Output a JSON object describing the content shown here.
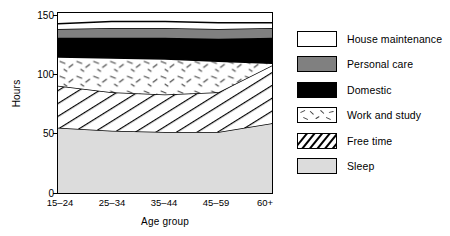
{
  "chart_data": {
    "type": "area",
    "title": "",
    "xlabel": "Age group",
    "ylabel": "Hours",
    "categories": [
      "15–24",
      "25–34",
      "35–44",
      "45–59",
      "60+"
    ],
    "ylim": [
      0,
      168
    ],
    "yticks": [
      0,
      50,
      100,
      150
    ],
    "ytick_labels": [
      "0",
      "50",
      "100",
      "150"
    ],
    "grid": false,
    "legend_position": "right",
    "stacked": true,
    "stack_order_bottom_to_top": [
      "Sleep",
      "Free time",
      "Work and study",
      "Domestic",
      "Personal care",
      "House maintenance"
    ],
    "series": [
      {
        "name": "Sleep",
        "fill": "#dcdcdc",
        "pattern": "solid",
        "values": [
          61,
          58,
          57,
          57,
          65
        ]
      },
      {
        "name": "Free time",
        "fill": "#ffffff",
        "pattern": "diagonal-hatch",
        "values": [
          39,
          36,
          35,
          37,
          54
        ]
      },
      {
        "name": "Work and study",
        "fill": "#ffffff",
        "pattern": "dashes",
        "values": [
          27,
          32,
          33,
          29,
          2
        ]
      },
      {
        "name": "Domestic",
        "fill": "#000000",
        "pattern": "solid",
        "values": [
          18,
          19,
          20,
          21,
          24
        ]
      },
      {
        "name": "Personal care",
        "fill": "#808080",
        "pattern": "solid",
        "values": [
          8,
          9,
          9,
          9,
          9
        ]
      },
      {
        "name": "House maintenance",
        "fill": "#ffffff",
        "pattern": "solid",
        "values": [
          5,
          6,
          6,
          6,
          5
        ]
      }
    ],
    "cumulative_tops": {
      "Sleep": [
        61,
        58,
        57,
        57,
        65
      ],
      "Free time": [
        100,
        94,
        92,
        94,
        119
      ],
      "Work and study": [
        127,
        126,
        125,
        123,
        121
      ],
      "Domestic": [
        145,
        145,
        145,
        144,
        145
      ],
      "Personal care": [
        153,
        154,
        154,
        153,
        154
      ],
      "House maintenance": [
        158,
        160,
        160,
        159,
        159
      ]
    }
  },
  "legend": {
    "items": [
      {
        "label": "House maintenance",
        "swatch": "white-solid"
      },
      {
        "label": "Personal care",
        "swatch": "gray-solid"
      },
      {
        "label": "Domestic",
        "swatch": "black-solid"
      },
      {
        "label": "Work and study",
        "swatch": "white-dashes"
      },
      {
        "label": "Free time",
        "swatch": "white-hatch"
      },
      {
        "label": "Sleep",
        "swatch": "lightgray-solid"
      }
    ]
  }
}
